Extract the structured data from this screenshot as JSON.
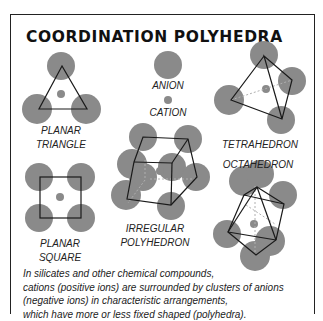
{
  "title": "COORDINATION POLYHEDRA",
  "colors": {
    "ion_fill": "#8a8a8a",
    "edge_stroke": "#1a1a1a",
    "hidden_edge_stroke": "#b0b0b0",
    "border": "#222222",
    "background": "#ffffff"
  },
  "legend": {
    "anion_label": "ANION",
    "cation_label": "CATION"
  },
  "figures": [
    {
      "id": "planar-triangle",
      "label_lines": [
        "PLANAR",
        "TRIANGLE"
      ],
      "anions": 3
    },
    {
      "id": "planar-square",
      "label_lines": [
        "PLANAR",
        "SQUARE"
      ],
      "anions": 4
    },
    {
      "id": "irregular-polyhedron",
      "label_lines": [
        "IRREGULAR",
        "POLYHEDRON"
      ],
      "anions": 8
    },
    {
      "id": "tetrahedron",
      "label_lines": [
        "TETRAHEDRON"
      ],
      "anions": 4
    },
    {
      "id": "octahedron",
      "label_lines": [
        "OCTAHEDRON"
      ],
      "anions": 6
    }
  ],
  "caption_lines": [
    "In silicates and other chemical compounds,",
    "cations (positive ions) are surrounded by clusters of anions",
    "(negative ions) in characteristic arrangements,",
    "which have more or less fixed shaped (polyhedra)."
  ]
}
